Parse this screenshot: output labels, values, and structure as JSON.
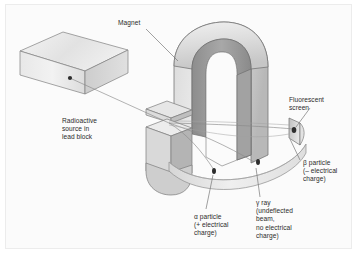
{
  "figure": {
    "title_alt": "Deflection of alpha, beta and gamma radiation by a magnetic field",
    "background_color": "#fbfbfb",
    "frame_color": "#ececec"
  },
  "colors": {
    "ink": "#2b2b2b",
    "leader_line": "#6e6e6e",
    "beam_line": "#8a8a8a",
    "magnet_top": "#e9e9e9",
    "magnet_outer": "#d2d2d2",
    "magnet_inner": "#9a9a9a",
    "magnet_dark": "#8d8d8d",
    "block_top": "#ededed",
    "block_front": "#e3e3e3",
    "block_side": "#cfcfcf",
    "band_face": "#e6e6e6",
    "band_edge": "#b9b9b9",
    "screen_face": "#cfcfcf",
    "spot": "#2d2d2d",
    "outline": "#7b7b7b"
  },
  "labels": {
    "magnet": {
      "name": "magnet-label",
      "lines": [
        "Magnet"
      ],
      "x": 112,
      "y": 14
    },
    "source": {
      "name": "radioactive-source-label",
      "lines": [
        "Radioactive",
        "source in",
        "lead block"
      ],
      "x": 56,
      "y": 112
    },
    "fluorescent_screen": {
      "name": "fluorescent-screen-label",
      "lines": [
        "Fluorescent",
        "screen"
      ],
      "x": 283,
      "y": 91
    },
    "beta": {
      "name": "beta-particle-label",
      "lines": [
        "β particle",
        "(– electrical",
        "charge)"
      ],
      "x": 297,
      "y": 154
    },
    "alpha": {
      "name": "alpha-particle-label",
      "lines": [
        "α particle",
        "(+ electrical",
        "charge)"
      ],
      "x": 188,
      "y": 208
    },
    "gamma": {
      "name": "gamma-ray-label",
      "lines": [
        "γ ray",
        "(undeflected",
        "beam,",
        "no electrical",
        "charge)"
      ],
      "x": 250,
      "y": 194
    }
  },
  "parts": {
    "lead_block": {
      "name": "lead-block",
      "description": "rectangular lead shielding block"
    },
    "source_dot": {
      "name": "radioactive-source-dot",
      "description": "point source of radiation inside lead block"
    },
    "magnet": {
      "name": "horseshoe-magnet",
      "description": "U-shaped magnet providing the magnetic field"
    },
    "detector_band": {
      "name": "detector-band",
      "description": "curved fluorescent detector strip"
    },
    "screen": {
      "name": "fluorescent-screen",
      "description": "upright fluorescent screen struck by beta particles"
    },
    "beams": {
      "name": "radiation-beams",
      "description": "three trajectories: alpha deflected one way, beta deflected the other, gamma undeflected"
    },
    "impact_spots": {
      "name": "impact-spots",
      "description": "dark marks where alpha, gamma and beta strike the detectors"
    }
  }
}
